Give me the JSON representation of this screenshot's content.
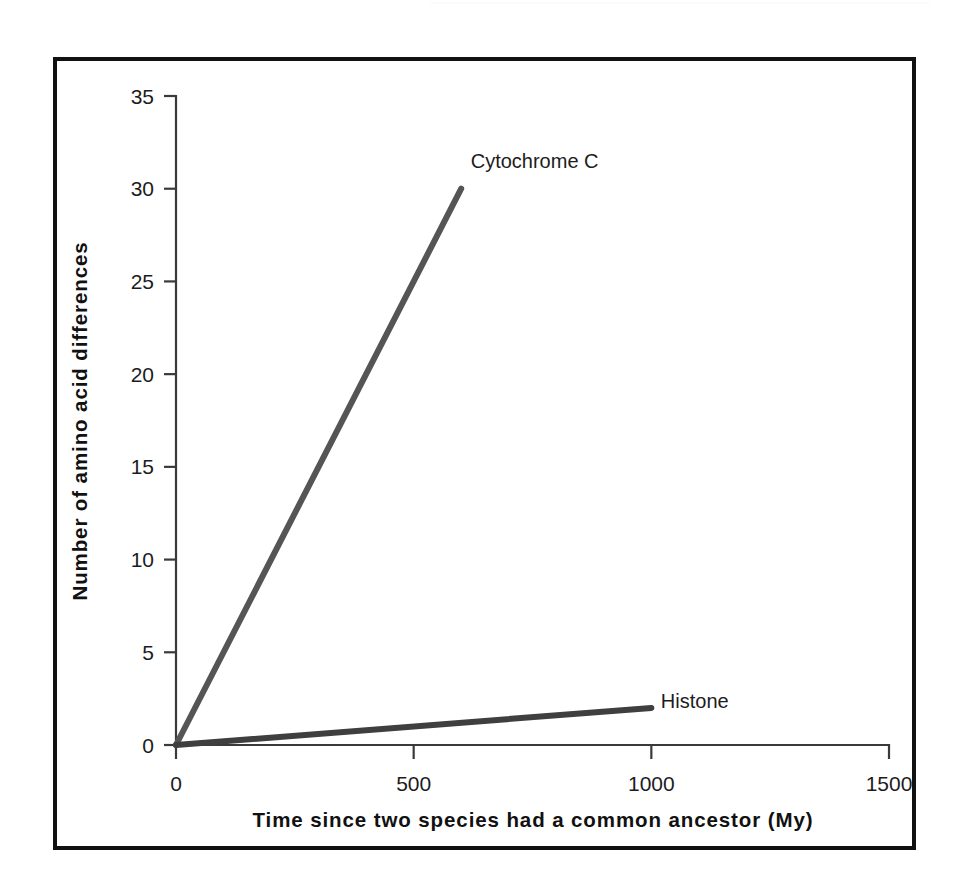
{
  "figure": {
    "frame_color": "#111111",
    "background": "#ffffff"
  },
  "chart_data": {
    "type": "line",
    "title": "",
    "xlabel": "Time since two species had a common ancestor (My)",
    "ylabel": "Number of amino acid differences",
    "xlim": [
      0,
      1500
    ],
    "ylim": [
      0,
      35
    ],
    "xticks": [
      0,
      500,
      1000,
      1500
    ],
    "yticks": [
      0,
      5,
      10,
      15,
      20,
      25,
      30,
      35
    ],
    "xtick_labels": [
      "0",
      "500",
      "1000",
      "1500"
    ],
    "ytick_labels": [
      "0",
      "5",
      "10",
      "15",
      "20",
      "25",
      "30",
      "35"
    ],
    "grid": false,
    "legend": "inline-end-of-line-labels",
    "series": [
      {
        "name": "Cytochrome C",
        "color": "#555555",
        "line_width": 6,
        "x": [
          0,
          600
        ],
        "y": [
          0,
          30
        ],
        "label": "Cytochrome C",
        "label_x": 620,
        "label_y": 31.5
      },
      {
        "name": "Histone",
        "color": "#3f3f3f",
        "line_width": 6,
        "x": [
          0,
          1000
        ],
        "y": [
          0,
          2
        ],
        "label": "Histone",
        "label_x": 1020,
        "label_y": 2.35
      }
    ]
  }
}
